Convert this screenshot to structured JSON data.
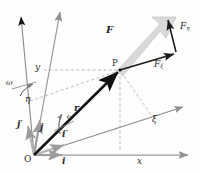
{
  "figure": {
    "background": "#fefefe",
    "colors": {
      "fixed_axis": "#9a9a9a",
      "rotating_axis": "#8c8c8c",
      "position_vector": "#151515",
      "force_vector": "#1a1a1a",
      "force_shaft_fill": "#d9d9d9",
      "dashed_guide": "#a9a9a9",
      "label_text": "#2b2b2b"
    }
  },
  "labels": {
    "origin": "O",
    "point": "P",
    "x_axis": "x",
    "y_axis": "y",
    "xi_axis": "ξ",
    "eta_axis": "η",
    "unit_i": "i",
    "unit_j": "j",
    "unit_i_prime": "i′",
    "unit_j_prime": "j′",
    "position_vector": "r",
    "force": "F",
    "force_xi": "F",
    "force_xi_sub": "ξ",
    "force_eta": "F",
    "force_eta_sub": "η",
    "omega_left": "ω",
    "omega_mid": "ω"
  },
  "geometry": {
    "origin_px": [
      34,
      155
    ],
    "point_P_px": [
      120,
      70
    ],
    "x_axis_end_px": [
      191,
      155
    ],
    "y_axis_end_px": [
      68,
      8
    ],
    "xi_axis_end_px": [
      186,
      105
    ],
    "eta_axis_end_px": [
      18,
      14
    ],
    "force_tip_px": [
      176,
      18
    ],
    "force_xi_tip_px": [
      178,
      52
    ],
    "x_coordinate_px": 140,
    "y_coordinate_px": 70,
    "rotation_angle_deg": 18
  }
}
